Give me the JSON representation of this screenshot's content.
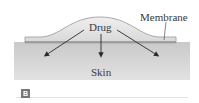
{
  "diagram": {
    "labels": {
      "drug": "Drug",
      "membrane": "Membrane",
      "skin": "Skin"
    },
    "panel_badge": "B",
    "colors": {
      "skin": "#cfcfcf",
      "patch_fill": "#e6e6e6",
      "patch_outline": "#a9a9a9",
      "membrane_layer": "#8f8f8f",
      "arrow": "#2b2b2b",
      "text": "#3a3a3a"
    }
  }
}
